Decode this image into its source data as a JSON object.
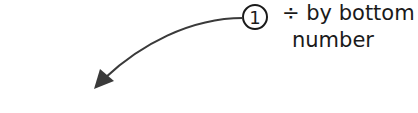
{
  "step": {
    "number": "1",
    "line1": "÷ by bottom",
    "line2": "number"
  },
  "equation": {
    "text": "35 ÷ 5 = 7",
    "dividend": "35",
    "operator": "÷",
    "divisor": "5",
    "equals": "=",
    "result": "7"
  },
  "colors": {
    "arrow": "#3a3a3a",
    "text": "#1a1a1a",
    "background": "#ffffff"
  }
}
